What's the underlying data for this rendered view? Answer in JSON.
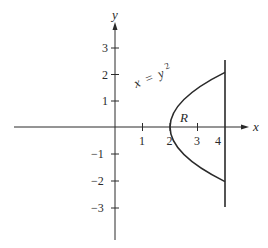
{
  "diagram": {
    "type": "region-plot",
    "axes": {
      "x_label": "x",
      "y_label": "y",
      "x_ticks": [
        "1",
        "2",
        "3",
        "4"
      ],
      "y_ticks_positive": [
        "1",
        "2",
        "3"
      ],
      "y_ticks_negative": [
        "−1",
        "−2",
        "−3"
      ]
    },
    "curve": {
      "label_x": "x",
      "label_eq": "=",
      "label_y": "y",
      "label_exp": "2",
      "equation": "x = y^2"
    },
    "boundary": {
      "line": "x = 4"
    },
    "region_label": "R",
    "colors": {
      "ink": "#2a2a2a",
      "background": "#ffffff"
    }
  }
}
